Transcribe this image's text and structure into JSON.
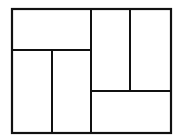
{
  "diagram": {
    "type": "rectangle-partition",
    "stroke_color": "#111111",
    "background": "#ffffff",
    "outer": {
      "x": 12,
      "y": 9,
      "w": 159,
      "h": 124
    },
    "regions": [
      {
        "id": "top-left-wide",
        "x": 12,
        "y": 9,
        "w": 79,
        "h": 41
      },
      {
        "id": "bottom-left-a",
        "x": 12,
        "y": 50,
        "w": 40,
        "h": 83
      },
      {
        "id": "bottom-left-b",
        "x": 52,
        "y": 50,
        "w": 39,
        "h": 83
      },
      {
        "id": "top-right-a",
        "x": 91,
        "y": 9,
        "w": 39,
        "h": 82
      },
      {
        "id": "top-right-b",
        "x": 130,
        "y": 9,
        "w": 41,
        "h": 82
      },
      {
        "id": "bottom-right-wide",
        "x": 91,
        "y": 91,
        "w": 80,
        "h": 42
      }
    ]
  }
}
